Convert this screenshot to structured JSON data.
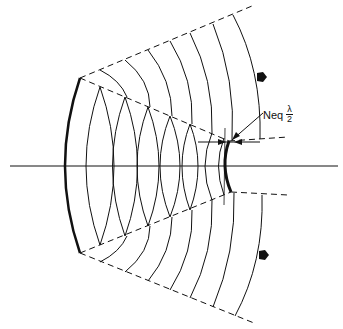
{
  "diagram": {
    "type": "unstable-resonator",
    "label": {
      "text": "Neq",
      "numerator": "λ",
      "denominator": "2"
    },
    "colors": {
      "line": "#111111",
      "background": "#ffffff"
    }
  }
}
